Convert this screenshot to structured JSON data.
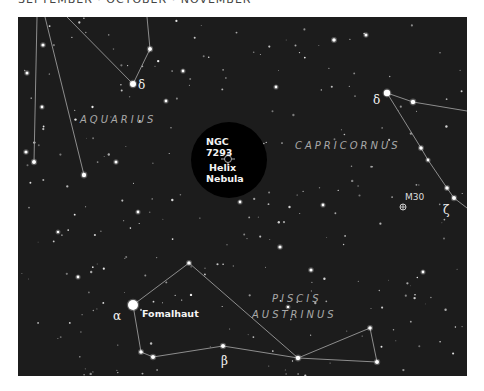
{
  "header": {
    "title": "SEPTEMBER · OCTOBER · NOVEMBER"
  },
  "colors": {
    "sky": "#1c1c1c",
    "highlight": "#000000",
    "lines": "#9a9a9a",
    "stars": "#ffffff",
    "constellation_label": "#a9a9a9"
  },
  "constellations": [
    {
      "name": "AQUARIUS",
      "x": 62,
      "y": 106
    },
    {
      "name": "CAPRICORNUS",
      "x": 277,
      "y": 132
    },
    {
      "name": "PISCIS",
      "x": 254,
      "y": 285
    },
    {
      "name": "AUSTRINUS",
      "x": 234,
      "y": 301
    }
  ],
  "greek_labels": [
    {
      "text": "δ",
      "x": 120,
      "y": 72
    },
    {
      "text": "δ",
      "x": 355,
      "y": 87
    },
    {
      "text": "ζ",
      "x": 425,
      "y": 197
    },
    {
      "text": "α",
      "x": 95,
      "y": 303
    },
    {
      "text": "β",
      "x": 203,
      "y": 348
    }
  ],
  "highlight": {
    "catalog": "NGC",
    "number": "7293",
    "name_line1": "Helix",
    "name_line2": "Nebula",
    "cx": 211,
    "cy": 143,
    "r": 38,
    "marker": {
      "x": 210,
      "y": 142
    }
  },
  "objects": [
    {
      "label": "M30",
      "x": 385,
      "y": 190,
      "label_x": 387,
      "label_y": 183
    }
  ],
  "named_stars": [
    {
      "name": "Fomalhaut",
      "x": 115,
      "y": 288,
      "label_x": 124,
      "label_y": 300
    }
  ],
  "lines": [
    [
      [
        19,
        0
      ],
      [
        16,
        145
      ]
    ],
    [
      [
        27,
        0
      ],
      [
        66,
        158
      ]
    ],
    [
      [
        49,
        0
      ],
      [
        115,
        67
      ]
    ],
    [
      [
        129,
        0
      ],
      [
        132,
        32
      ],
      [
        115,
        67
      ]
    ],
    [
      [
        369,
        76
      ],
      [
        395,
        85
      ],
      [
        449,
        94
      ]
    ],
    [
      [
        369,
        76
      ],
      [
        403,
        131
      ],
      [
        410,
        143
      ],
      [
        429,
        171
      ],
      [
        436,
        181
      ],
      [
        449,
        191
      ]
    ],
    [
      [
        115,
        288
      ],
      [
        171,
        246
      ],
      [
        280,
        341
      ]
    ],
    [
      [
        115,
        288
      ],
      [
        123,
        335
      ],
      [
        135,
        340
      ],
      [
        205,
        329
      ],
      [
        280,
        341
      ],
      [
        359,
        345
      ],
      [
        352,
        311
      ],
      [
        280,
        341
      ]
    ]
  ],
  "bright_stars": [
    {
      "x": 115,
      "y": 67,
      "r": 3
    },
    {
      "x": 369,
      "y": 76,
      "r": 3.2
    },
    {
      "x": 115,
      "y": 288,
      "r": 5
    },
    {
      "x": 395,
      "y": 85,
      "r": 2.2
    },
    {
      "x": 132,
      "y": 32,
      "r": 2
    },
    {
      "x": 16,
      "y": 145,
      "r": 2
    },
    {
      "x": 66,
      "y": 158,
      "r": 2.2
    },
    {
      "x": 403,
      "y": 131,
      "r": 1.8
    },
    {
      "x": 410,
      "y": 143,
      "r": 1.4
    },
    {
      "x": 429,
      "y": 171,
      "r": 1.8
    },
    {
      "x": 436,
      "y": 181,
      "r": 2
    },
    {
      "x": 171,
      "y": 246,
      "r": 1.8
    },
    {
      "x": 123,
      "y": 335,
      "r": 1.8
    },
    {
      "x": 135,
      "y": 340,
      "r": 2
    },
    {
      "x": 205,
      "y": 329,
      "r": 2
    },
    {
      "x": 280,
      "y": 341,
      "r": 2.2
    },
    {
      "x": 352,
      "y": 311,
      "r": 1.8
    },
    {
      "x": 359,
      "y": 345,
      "r": 2
    },
    {
      "x": 8,
      "y": 135,
      "r": 1.6
    },
    {
      "x": 9,
      "y": 56,
      "r": 1.5
    },
    {
      "x": 25,
      "y": 28,
      "r": 1.6
    },
    {
      "x": 98,
      "y": 145,
      "r": 1.5
    },
    {
      "x": 148,
      "y": 84,
      "r": 1.4
    },
    {
      "x": 316,
      "y": 23,
      "r": 1.8
    },
    {
      "x": 348,
      "y": 18,
      "r": 1.5
    },
    {
      "x": 165,
      "y": 54,
      "r": 1.4
    },
    {
      "x": 258,
      "y": 70,
      "r": 1.4
    },
    {
      "x": 24,
      "y": 90,
      "r": 1.4
    },
    {
      "x": 262,
      "y": 230,
      "r": 1.6
    },
    {
      "x": 293,
      "y": 253,
      "r": 1.6
    },
    {
      "x": 405,
      "y": 255,
      "r": 1.4
    },
    {
      "x": 453,
      "y": 300,
      "r": 1.4
    },
    {
      "x": 305,
      "y": 188,
      "r": 1.4
    },
    {
      "x": 222,
      "y": 185,
      "r": 1.4
    },
    {
      "x": 120,
      "y": 195,
      "r": 1.4
    },
    {
      "x": 60,
      "y": 260,
      "r": 1.4
    },
    {
      "x": 40,
      "y": 215,
      "r": 1.3
    },
    {
      "x": 270,
      "y": 290,
      "r": 1.3
    }
  ],
  "faint_star_seed": 7293,
  "faint_star_count": 260
}
